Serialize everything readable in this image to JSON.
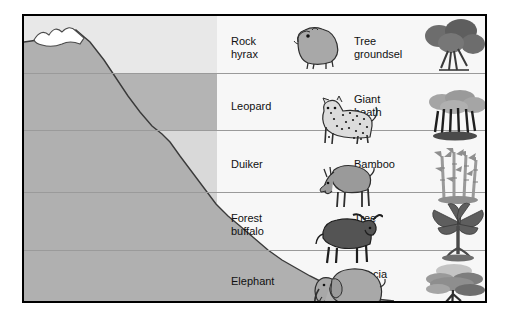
{
  "diagram": {
    "colors": {
      "frame_border": "#000000",
      "panel_background": "#f7f7f7",
      "band_light": "#e8e8e8",
      "band_dark": "#b4b4b4",
      "mountain_fill": "#b0b0b0",
      "mountain_outline": "#3a3a3a",
      "snow_fill": "#ffffff",
      "divider": "#9a9a9a",
      "text": "#111111"
    },
    "bands": [
      {
        "zone": "Alpine",
        "elevation": "(3,650 m)",
        "animal": "Rock\nhyrax",
        "animal_line1": "Rock",
        "animal_line2": "hyrax",
        "plant": "Tree\ngroundsel",
        "plant_line1": "Tree",
        "plant_line2": "groundsel",
        "animal_icon": "rock-hyrax-icon",
        "plant_icon": "tree-groundsel-icon",
        "shade": "light"
      },
      {
        "zone": "Heath",
        "elevation": "(3,080 m)",
        "animal": "Leopard",
        "animal_line1": "Leopard",
        "animal_line2": "",
        "plant": "Giant\nheath",
        "plant_line1": "Giant",
        "plant_line2": "heath",
        "animal_icon": "leopard-icon",
        "plant_icon": "giant-heath-icon",
        "shade": "dark"
      },
      {
        "zone": "Bamboo",
        "elevation": "(2,275 m)",
        "animal": "Duiker",
        "animal_line1": "Duiker",
        "animal_line2": "",
        "plant": "Bamboo",
        "plant_line1": "Bamboo",
        "plant_line2": "",
        "animal_icon": "duiker-icon",
        "plant_icon": "bamboo-icon",
        "shade": "light"
      },
      {
        "zone": "Rain forest",
        "elevation": "(1,650 m)",
        "animal": "Forest\nbuffalo",
        "animal_line1": "Forest",
        "animal_line2": "buffalo",
        "plant": "Tree\nfern",
        "plant_line1": "Tree",
        "plant_line2": "fern",
        "animal_icon": "forest-buffalo-icon",
        "plant_icon": "tree-fern-icon",
        "shade": "light-medium"
      },
      {
        "zone": "Savanna",
        "elevation": "",
        "animal": "Elephant",
        "animal_line1": "Elephant",
        "animal_line2": "",
        "plant": "Acacia\ntree",
        "plant_line1": "Acacia",
        "plant_line2": "tree",
        "animal_icon": "elephant-icon",
        "plant_icon": "acacia-tree-icon",
        "shade": "dark"
      }
    ]
  }
}
